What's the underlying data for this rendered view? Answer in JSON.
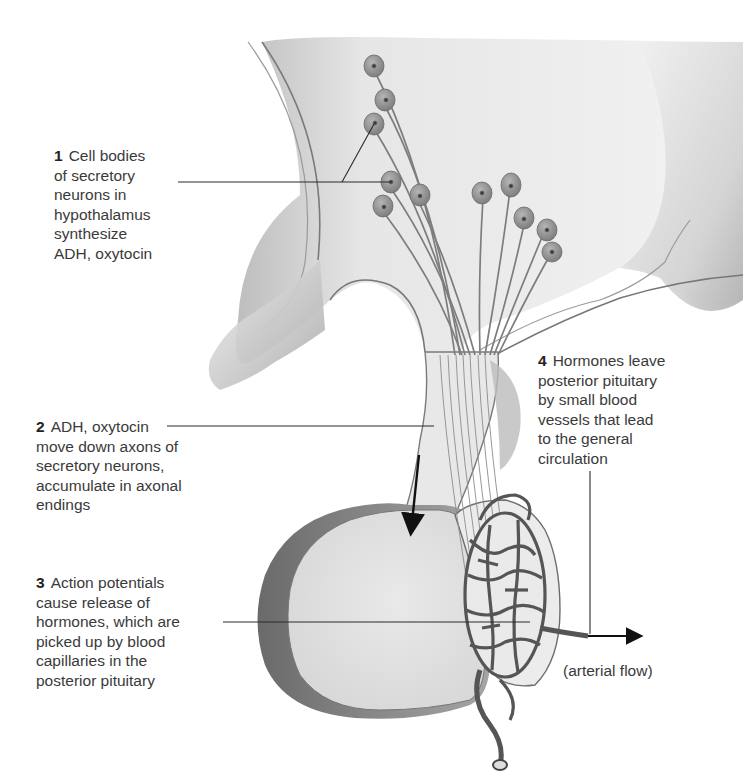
{
  "figure": {
    "colors": {
      "tissue_light": "#ececec",
      "tissue_shade": "#9a9a9a",
      "outline": "#6e6e6e",
      "neuron_body": "#8f8f8f",
      "vessel": "#5e5e5e",
      "leader_line": "#2a2a2a",
      "text": "#3a3a3a"
    }
  },
  "labels": [
    {
      "number": "1",
      "lines": [
        "Cell bodies",
        "of secretory",
        "neurons in",
        "hypothalamus",
        "synthesize",
        "ADH, oxytocin"
      ]
    },
    {
      "number": "2",
      "lines": [
        "ADH, oxytocin",
        "move down axons of",
        "secretory neurons,",
        "accumulate in axonal",
        "endings"
      ]
    },
    {
      "number": "3",
      "lines": [
        "Action potentials",
        "cause release of",
        "hormones, which are",
        "picked up by blood",
        "capillaries in the",
        "posterior pituitary"
      ]
    },
    {
      "number": "4",
      "lines": [
        "Hormones leave",
        "posterior pituitary",
        "by small blood",
        "vessels that lead",
        "to the general",
        "circulation"
      ]
    }
  ],
  "annotations": {
    "arterial_flow": "(arterial flow)"
  }
}
